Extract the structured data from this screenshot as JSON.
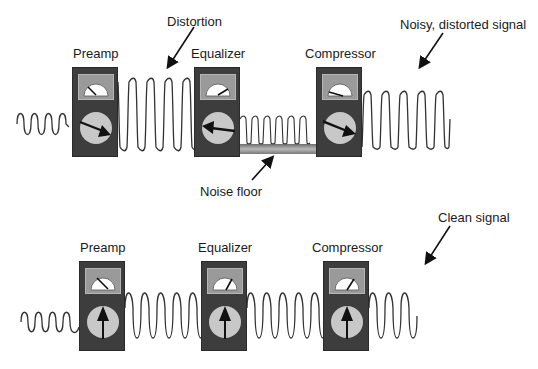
{
  "top_chain": {
    "annotations": {
      "distortion": "Distortion",
      "noise_floor": "Noise floor",
      "output": "Noisy, distorted signal"
    },
    "devices": [
      {
        "name": "Preamp",
        "meter_needle": "left",
        "knob_pointer": "down-right"
      },
      {
        "name": "Equalizer",
        "meter_needle": "right",
        "knob_pointer": "left"
      },
      {
        "name": "Compressor",
        "meter_needle": "left-low",
        "knob_pointer": "down-right"
      }
    ],
    "signal_stages": [
      "small sine",
      "clipped large square-ish",
      "clipped medium over noise floor",
      "clipped large"
    ]
  },
  "bottom_chain": {
    "annotations": {
      "output": "Clean signal"
    },
    "devices": [
      {
        "name": "Preamp",
        "meter_needle": "left",
        "knob_pointer": "up"
      },
      {
        "name": "Equalizer",
        "meter_needle": "right",
        "knob_pointer": "up"
      },
      {
        "name": "Compressor",
        "meter_needle": "right",
        "knob_pointer": "up"
      }
    ],
    "signal_stages": [
      "small sine",
      "large sine",
      "large sine",
      "large sine"
    ]
  },
  "colors": {
    "device_body": "#3d3d3d",
    "meter_panel": "#9a9a9a",
    "knob_face": "#c8c8c8",
    "wave": "#333333",
    "noise_floor": "#8c8c8c"
  }
}
